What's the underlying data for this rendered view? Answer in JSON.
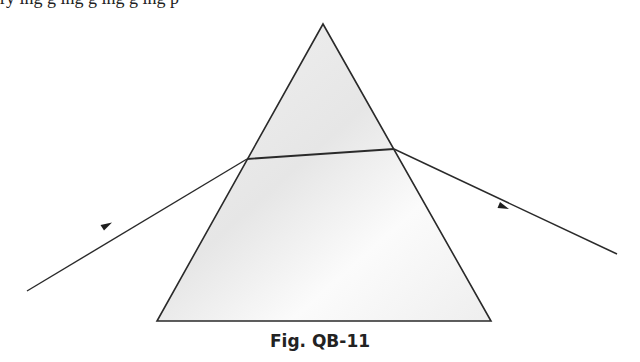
{
  "top_text_fragment": "ry  ing  g  ing  g  ing  g  ing  p",
  "figure": {
    "caption": "Fig. QB-11",
    "prism": {
      "apex": [
        323,
        24
      ],
      "base_left": [
        157,
        321
      ],
      "base_right": [
        491,
        321
      ],
      "fill_top": "#ececec",
      "fill_bottom": "#f5f5f5",
      "stroke": "#2a2a2a"
    },
    "rays": {
      "incident": {
        "from": [
          27,
          291
        ],
        "to": [
          247,
          159
        ],
        "arrow_at": [
          106,
          226
        ]
      },
      "internal": {
        "from": [
          247,
          159
        ],
        "to": [
          394,
          149
        ]
      },
      "emergent": {
        "from": [
          394,
          149
        ],
        "to": [
          617,
          254
        ],
        "arrow_at": [
          503,
          206
        ]
      },
      "color": "#2a2a2a"
    }
  }
}
